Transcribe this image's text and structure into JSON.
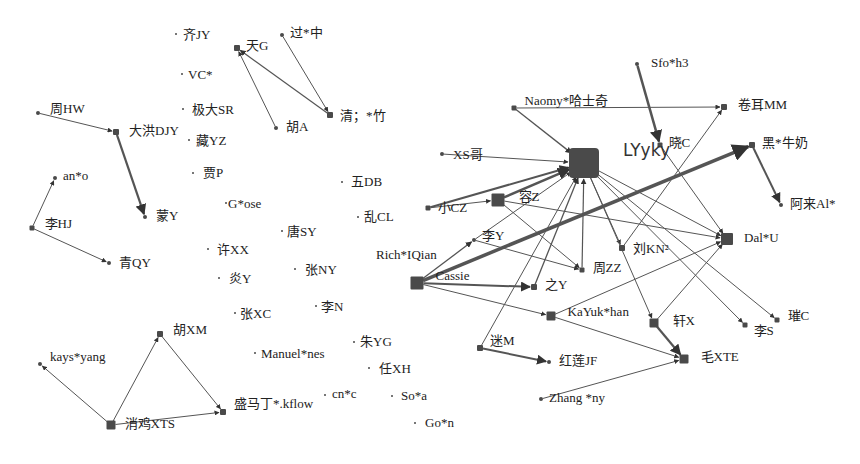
{
  "diagram": {
    "type": "directed social network graph",
    "nodes": [
      {
        "id": "qiJY",
        "label": "齐JY",
        "x": 176,
        "y": 34,
        "size": 2,
        "lx": 6,
        "ly": 5
      },
      {
        "id": "tianG",
        "label": "天G",
        "x": 237,
        "y": 48,
        "size": 6,
        "lx": 6,
        "ly": 2
      },
      {
        "id": "guoZhong",
        "label": "过*中",
        "x": 282,
        "y": 35,
        "size": 4,
        "lx": 6,
        "ly": 2
      },
      {
        "id": "VC",
        "label": "VC*",
        "x": 182,
        "y": 74,
        "size": 2,
        "lx": 5,
        "ly": 5
      },
      {
        "id": "jidaSR",
        "label": "极大SR",
        "x": 183,
        "y": 109,
        "size": 2,
        "lx": 8,
        "ly": 5
      },
      {
        "id": "qingZhu",
        "label": "清；*竹",
        "x": 330,
        "y": 115,
        "size": 6,
        "lx": 7,
        "ly": 5
      },
      {
        "id": "zhouHW",
        "label": "周HW",
        "x": 38,
        "y": 113,
        "size": 4,
        "lx": 10,
        "ly": 0
      },
      {
        "id": "dahongDJY",
        "label": "大洪DJY",
        "x": 116,
        "y": 132,
        "size": 6,
        "lx": 10,
        "ly": 3
      },
      {
        "id": "huA",
        "label": "胡A",
        "x": 276,
        "y": 128,
        "size": 4,
        "lx": 8,
        "ly": 3
      },
      {
        "id": "zangYZ",
        "label": "藏YZ",
        "x": 189,
        "y": 140,
        "size": 2,
        "lx": 6,
        "ly": 5
      },
      {
        "id": "jiaP",
        "label": "贾P",
        "x": 193,
        "y": 173,
        "size": 2,
        "lx": 9,
        "ly": 4
      },
      {
        "id": "anO",
        "label": "an*o",
        "x": 55,
        "y": 178,
        "size": 4,
        "lx": 6,
        "ly": 2
      },
      {
        "id": "wuDB",
        "label": "五DB",
        "x": 342,
        "y": 182,
        "size": 2,
        "lx": 8,
        "ly": 4
      },
      {
        "id": "gOse",
        "label": "G*ose",
        "x": 226,
        "y": 203,
        "size": 2,
        "lx": 1,
        "ly": 5
      },
      {
        "id": "mengY",
        "label": "蒙Y",
        "x": 145,
        "y": 217,
        "size": 4,
        "lx": 9,
        "ly": 3
      },
      {
        "id": "luanCL",
        "label": "乱CL",
        "x": 358,
        "y": 217,
        "size": 2,
        "lx": 5,
        "ly": 4
      },
      {
        "id": "liHJ",
        "label": "李HJ",
        "x": 32,
        "y": 228,
        "size": 5,
        "lx": 10,
        "ly": 0
      },
      {
        "id": "tangSY",
        "label": "唐SY",
        "x": 282,
        "y": 231,
        "size": 2,
        "lx": 4,
        "ly": 5
      },
      {
        "id": "xuXX",
        "label": "许XX",
        "x": 208,
        "y": 249,
        "size": 2,
        "lx": 8,
        "ly": 5
      },
      {
        "id": "qingQY",
        "label": "青QY",
        "x": 109,
        "y": 263,
        "size": 4,
        "lx": 8,
        "ly": 4
      },
      {
        "id": "zhangNY",
        "label": "张NY",
        "x": 295,
        "y": 269,
        "size": 2,
        "lx": 9,
        "ly": 5
      },
      {
        "id": "yanY",
        "label": "炎Y",
        "x": 219,
        "y": 278,
        "size": 2,
        "lx": 9,
        "ly": 5
      },
      {
        "id": "liN",
        "label": "李N",
        "x": 316,
        "y": 306,
        "size": 2,
        "lx": 4,
        "ly": 5
      },
      {
        "id": "zhangXC",
        "label": "张XC",
        "x": 235,
        "y": 313,
        "size": 2,
        "lx": 4,
        "ly": 5
      },
      {
        "id": "huXM",
        "label": "胡XM",
        "x": 160,
        "y": 334,
        "size": 6,
        "lx": 10,
        "ly": 0
      },
      {
        "id": "zhuYG",
        "label": "朱YG",
        "x": 354,
        "y": 342,
        "size": 2,
        "lx": 5,
        "ly": 4
      },
      {
        "id": "manuelNes",
        "label": "Manuel*nes",
        "x": 255,
        "y": 353,
        "size": 2,
        "lx": 5,
        "ly": 5
      },
      {
        "id": "kaysYang",
        "label": "kays*yang",
        "x": 40,
        "y": 364,
        "size": 4,
        "lx": 8,
        "ly": -3
      },
      {
        "id": "renXH",
        "label": "任XH",
        "x": 369,
        "y": 368,
        "size": 2,
        "lx": 9,
        "ly": 5
      },
      {
        "id": "shengMaDing",
        "label": "盛马丁*.kflow",
        "x": 223,
        "y": 412,
        "size": 6,
        "lx": 8,
        "ly": -4
      },
      {
        "id": "cnC",
        "label": "cn*c",
        "x": 325,
        "y": 395,
        "size": 2,
        "lx": 6,
        "ly": 3
      },
      {
        "id": "soA",
        "label": "So*a",
        "x": 392,
        "y": 396,
        "size": 2,
        "lx": 8,
        "ly": 4
      },
      {
        "id": "xiaojiXTS",
        "label": "消鸡XTS",
        "x": 111,
        "y": 425,
        "size": 9,
        "lx": 9,
        "ly": 3
      },
      {
        "id": "goN",
        "label": "Go*n",
        "x": 415,
        "y": 423,
        "size": 2,
        "lx": 9,
        "ly": 4
      },
      {
        "id": "sfoH3",
        "label": "Sfo*h3",
        "x": 637,
        "y": 64,
        "size": 4,
        "lx": 12,
        "ly": 3
      },
      {
        "id": "naomy",
        "label": "Naomy*哈士奇",
        "x": 514,
        "y": 108,
        "size": 5,
        "lx": 8,
        "ly": -3
      },
      {
        "id": "juanerMM",
        "label": "卷耳MM",
        "x": 724,
        "y": 107,
        "size": 6,
        "lx": 11,
        "ly": 2
      },
      {
        "id": "xiaoC",
        "label": "晓C",
        "x": 660,
        "y": 145,
        "size": 5,
        "lx": 6,
        "ly": 2
      },
      {
        "id": "heiNiunai",
        "label": "黑*牛奶",
        "x": 752,
        "y": 145,
        "size": 6,
        "lx": 7,
        "ly": 2
      },
      {
        "id": "xsGe",
        "label": "XS哥",
        "x": 442,
        "y": 154,
        "size": 4,
        "lx": 9,
        "ly": 5
      },
      {
        "id": "LYyky",
        "label": "LYyky",
        "x": 584,
        "y": 163,
        "size": 30,
        "lx": 24,
        "ly": -7
      },
      {
        "id": "xiaoCZ",
        "label": "小CZ",
        "x": 428,
        "y": 208,
        "size": 5,
        "lx": 7,
        "ly": 4
      },
      {
        "id": "rongZ",
        "label": "容Z",
        "x": 498,
        "y": 200,
        "size": 13,
        "lx": 14,
        "ly": 1
      },
      {
        "id": "aLaiAl",
        "label": "阿来Al*",
        "x": 781,
        "y": 205,
        "size": 4,
        "lx": 7,
        "ly": 3
      },
      {
        "id": "liY",
        "label": "李Y",
        "x": 474,
        "y": 240,
        "size": 4,
        "lx": 6,
        "ly": 0
      },
      {
        "id": "liuKN",
        "label": "刘KN²",
        "x": 622,
        "y": 248,
        "size": 6,
        "lx": 8,
        "ly": 5
      },
      {
        "id": "dalU",
        "label": "Dal*U",
        "x": 727,
        "y": 239,
        "size": 12,
        "lx": 11,
        "ly": 3
      },
      {
        "id": "zhouZZ",
        "label": "周ZZ",
        "x": 582,
        "y": 270,
        "size": 5,
        "lx": 8,
        "ly": 2
      },
      {
        "id": "richIQian",
        "label": "Rich*IQian",
        "x": 376,
        "y": 259,
        "size": 0,
        "lx": 0,
        "ly": 0
      },
      {
        "id": "cassie",
        "label": "Cassie",
        "x": 417,
        "y": 283,
        "size": 13,
        "lx": 12,
        "ly": -3
      },
      {
        "id": "zhiY",
        "label": "之Y",
        "x": 534,
        "y": 287,
        "size": 6,
        "lx": 8,
        "ly": 2
      },
      {
        "id": "kaYukHan",
        "label": "KaYuk*han",
        "x": 551,
        "y": 316,
        "size": 9,
        "lx": 12,
        "ly": 0
      },
      {
        "id": "xuanX",
        "label": "轩X",
        "x": 654,
        "y": 323,
        "size": 9,
        "lx": 14,
        "ly": 2
      },
      {
        "id": "liS",
        "label": "李S",
        "x": 745,
        "y": 325,
        "size": 5,
        "lx": 6,
        "ly": 10
      },
      {
        "id": "cuiC",
        "label": "璀C",
        "x": 777,
        "y": 320,
        "size": 5,
        "lx": 8,
        "ly": 0
      },
      {
        "id": "miM",
        "label": "迷M",
        "x": 480,
        "y": 348,
        "size": 6,
        "lx": 7,
        "ly": -3
      },
      {
        "id": "hongLianJF",
        "label": "红莲JF",
        "x": 549,
        "y": 362,
        "size": 4,
        "lx": 8,
        "ly": 3
      },
      {
        "id": "maoXTE",
        "label": "毛XTE",
        "x": 684,
        "y": 359,
        "size": 9,
        "lx": 12,
        "ly": 2
      },
      {
        "id": "zhangNy",
        "label": "Zhang *ny",
        "x": 541,
        "y": 399,
        "size": 4,
        "lx": 6,
        "ly": 3
      }
    ],
    "edges": [
      {
        "from": "guoZhong",
        "to": "qingZhu",
        "w": 1
      },
      {
        "from": "qingZhu",
        "to": "tianG",
        "w": 1.2
      },
      {
        "from": "huA",
        "to": "tianG",
        "w": 1
      },
      {
        "from": "zhouHW",
        "to": "dahongDJY",
        "w": 1
      },
      {
        "from": "dahongDJY",
        "to": "mengY",
        "w": 2.2
      },
      {
        "from": "liHJ",
        "to": "anO",
        "w": 1
      },
      {
        "from": "liHJ",
        "to": "qingQY",
        "w": 1
      },
      {
        "from": "xiaojiXTS",
        "to": "kaysYang",
        "w": 1
      },
      {
        "from": "xiaojiXTS",
        "to": "huXM",
        "w": 1
      },
      {
        "from": "huXM",
        "to": "shengMaDing",
        "w": 1
      },
      {
        "from": "xiaojiXTS",
        "to": "shengMaDing",
        "w": 1
      },
      {
        "from": "sfoH3",
        "to": "xiaoC",
        "w": 2.5
      },
      {
        "from": "naomy",
        "to": "juanerMM",
        "w": 1
      },
      {
        "from": "naomy",
        "to": "LYyky",
        "w": 1.3
      },
      {
        "from": "xsGe",
        "to": "LYyky",
        "w": 1
      },
      {
        "from": "xiaoCZ",
        "to": "LYyky",
        "w": 2
      },
      {
        "from": "xiaoCZ",
        "to": "rongZ",
        "w": 1
      },
      {
        "from": "rongZ",
        "to": "LYyky",
        "w": 2.5
      },
      {
        "from": "liY",
        "to": "LYyky",
        "w": 1
      },
      {
        "from": "cassie",
        "to": "heiNiunai",
        "w": 3.5
      },
      {
        "from": "heiNiunai",
        "to": "aLaiAl",
        "w": 2
      },
      {
        "from": "cassie",
        "to": "liY",
        "w": 1.3
      },
      {
        "from": "cassie",
        "to": "zhiY",
        "w": 2
      },
      {
        "from": "cassie",
        "to": "kaYukHan",
        "w": 1
      },
      {
        "from": "zhiY",
        "to": "LYyky",
        "w": 1.3
      },
      {
        "from": "miM",
        "to": "LYyky",
        "w": 1
      },
      {
        "from": "miM",
        "to": "hongLianJF",
        "w": 2
      },
      {
        "from": "zhouZZ",
        "to": "LYyky",
        "w": 0
      },
      {
        "from": "rongZ",
        "to": "zhouZZ",
        "w": 1
      },
      {
        "from": "liY",
        "to": "zhouZZ",
        "w": 1
      },
      {
        "from": "rongZ",
        "to": "dalU",
        "w": 1
      },
      {
        "from": "LYyky",
        "to": "liuKN",
        "w": 1
      },
      {
        "from": "liuKN",
        "to": "juanerMM",
        "w": 1
      },
      {
        "from": "LYyky",
        "to": "dalU",
        "w": 1
      },
      {
        "from": "LYyky",
        "to": "liS",
        "w": 1
      },
      {
        "from": "LYyky",
        "to": "cuiC",
        "w": 1
      },
      {
        "from": "xiaoC",
        "to": "dalU",
        "w": 1
      },
      {
        "from": "LYyky",
        "to": "xuanX",
        "w": 1
      },
      {
        "from": "xuanX",
        "to": "dalU",
        "w": 1
      },
      {
        "from": "kaYukHan",
        "to": "dalU",
        "w": 1
      },
      {
        "from": "xuanX",
        "to": "maoXTE",
        "w": 2.2
      },
      {
        "from": "kaYukHan",
        "to": "maoXTE",
        "w": 1
      },
      {
        "from": "zhangNy",
        "to": "maoXTE",
        "w": 1
      },
      {
        "from": "zhouZZ",
        "to": "LYyky",
        "w": 1.2
      }
    ]
  }
}
